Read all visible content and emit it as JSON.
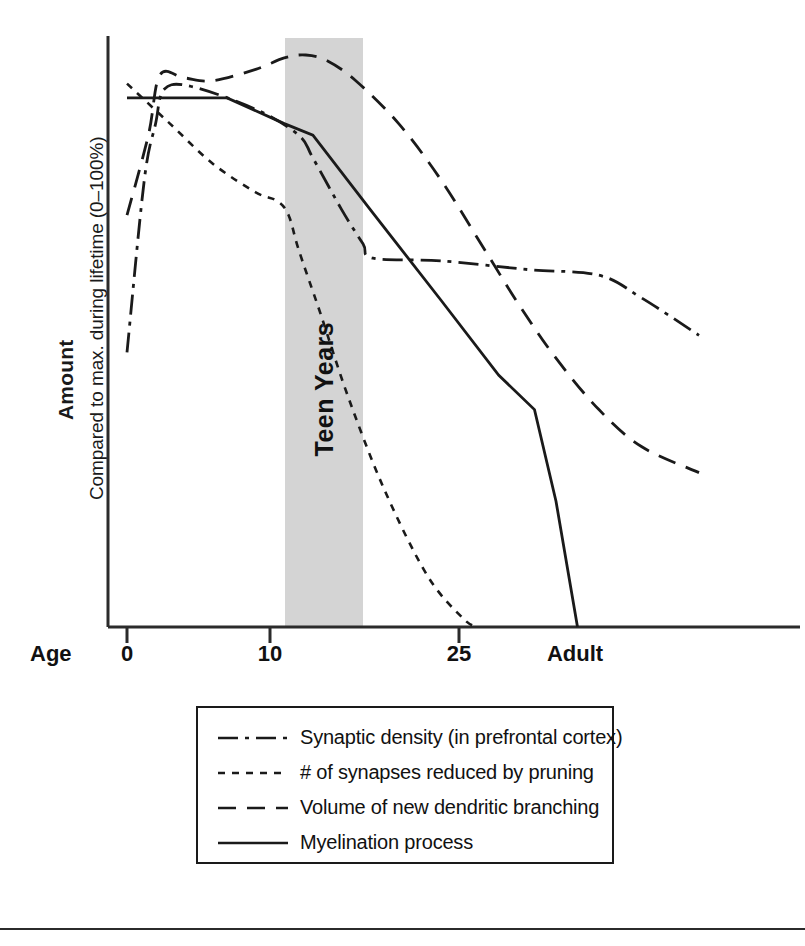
{
  "chart_data": {
    "type": "line",
    "title": "",
    "ylabel": "Amount",
    "ylabel_sub": "Compared to max. during lifetime (0–100%)",
    "xlabel": "Age",
    "xlim": [
      0,
      40
    ],
    "ylim": [
      0,
      100
    ],
    "grid": false,
    "legend_position": "below",
    "x_ticks": [
      {
        "label": "0",
        "x": 0
      },
      {
        "label": "10",
        "x": 10
      },
      {
        "label": "25",
        "x": 25
      },
      {
        "label": "Adult",
        "x": 36
      }
    ],
    "annotations": [
      {
        "text": "Teen Years",
        "type": "shaded-band",
        "x_start": 11,
        "x_end": 17,
        "color": "#d4d4d4"
      }
    ],
    "series": [
      {
        "name": "Synaptic density (in prefrontal cortex)",
        "style": "dash-dot",
        "points": [
          [
            0.0,
            48.0
          ],
          [
            1.2,
            78.0
          ],
          [
            2.0,
            88.0
          ],
          [
            2.6,
            94.0
          ],
          [
            4.5,
            94.5
          ],
          [
            9.0,
            90.5
          ],
          [
            12.0,
            86.0
          ],
          [
            13.0,
            82.0
          ],
          [
            15.0,
            73.0
          ],
          [
            16.5,
            67.0
          ],
          [
            17.2,
            64.5
          ],
          [
            22.0,
            64.0
          ],
          [
            28.0,
            62.5
          ],
          [
            33.0,
            61.5
          ],
          [
            36.0,
            57.5
          ],
          [
            40.0,
            51.0
          ]
        ]
      },
      {
        "name": "# of synapses reduced by pruning",
        "style": "dotted",
        "points": [
          [
            0.0,
            95.0
          ],
          [
            3.0,
            88.0
          ],
          [
            6.0,
            81.0
          ],
          [
            9.0,
            76.0
          ],
          [
            10.5,
            74.5
          ],
          [
            11.3,
            72.0
          ],
          [
            12.0,
            66.0
          ],
          [
            13.5,
            55.0
          ],
          [
            15.5,
            40.0
          ],
          [
            18.0,
            24.0
          ],
          [
            21.0,
            9.0
          ],
          [
            23.5,
            1.5
          ],
          [
            24.5,
            0.0
          ]
        ]
      },
      {
        "name": "Volume of new dendritic branching",
        "style": "dashed",
        "points": [
          [
            0.0,
            72.0
          ],
          [
            1.5,
            86.0
          ],
          [
            2.3,
            96.5
          ],
          [
            4.0,
            96.0
          ],
          [
            6.0,
            95.5
          ],
          [
            9.0,
            97.5
          ],
          [
            11.0,
            99.5
          ],
          [
            12.5,
            100.0
          ],
          [
            14.0,
            99.0
          ],
          [
            16.0,
            95.5
          ],
          [
            19.0,
            88.0
          ],
          [
            22.0,
            78.0
          ],
          [
            25.0,
            66.0
          ],
          [
            27.5,
            56.0
          ],
          [
            30.0,
            47.0
          ],
          [
            33.0,
            38.0
          ],
          [
            36.0,
            31.5
          ],
          [
            40.0,
            27.0
          ]
        ]
      },
      {
        "name": "Myelination process",
        "style": "solid",
        "points": [
          [
            0.0,
            92.5
          ],
          [
            7.0,
            92.5
          ],
          [
            11.0,
            88.0
          ],
          [
            13.0,
            86.0
          ],
          [
            17.0,
            73.0
          ],
          [
            22.0,
            57.0
          ],
          [
            26.0,
            44.0
          ],
          [
            28.5,
            38.0
          ],
          [
            30.0,
            22.0
          ],
          [
            31.5,
            0.0
          ]
        ]
      }
    ]
  },
  "axis": {
    "axis_name_label": "Age",
    "tick_0": "0",
    "tick_10": "10",
    "tick_25": "25",
    "tick_adult": "Adult"
  },
  "band": {
    "label": "Teen Years",
    "color": "#d4d4d4"
  },
  "legend": {
    "items": [
      {
        "label": "Synaptic density (in prefrontal cortex)",
        "style": "dash-dot"
      },
      {
        "label": "# of synapses reduced by pruning",
        "style": "dotted"
      },
      {
        "label": "Volume of new dendritic branching",
        "style": "dashed"
      },
      {
        "label": "Myelination process",
        "style": "solid"
      }
    ]
  },
  "colors": {
    "line": "#1a1a1a",
    "band": "#d4d4d4",
    "axis": "#2b2b2b",
    "background": "#ffffff"
  }
}
